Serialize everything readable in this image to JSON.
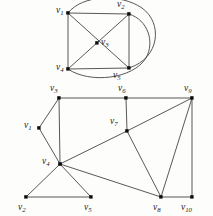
{
  "figure": {
    "background_color": "#fdfdfc",
    "edge_color": "#3a3a3a",
    "vertex_color": "#0d0d0d",
    "label_color": "#1a1a1a"
  },
  "graphs": [
    {
      "id": "upper-graph",
      "name": "upper-graph",
      "vertex_count": 5,
      "edge_count": 8,
      "vertices": [
        {
          "id": "v1",
          "label_main": "v",
          "label_sub": "1",
          "x": 68,
          "y": 13,
          "label_x": 56,
          "label_y": 11,
          "label_anchor": "start"
        },
        {
          "id": "v2",
          "label_main": "v",
          "label_sub": "2",
          "x": 129,
          "y": 14,
          "label_x": 117,
          "label_y": 5,
          "label_anchor": "start"
        },
        {
          "id": "v3",
          "label_main": "v",
          "label_sub": "3",
          "x": 97,
          "y": 43,
          "label_x": 101,
          "label_y": 43,
          "label_anchor": "start"
        },
        {
          "id": "v4",
          "label_main": "v",
          "label_sub": "4",
          "x": 68,
          "y": 69,
          "label_x": 56,
          "label_y": 68,
          "label_anchor": "start"
        },
        {
          "id": "v5",
          "label_main": "v",
          "label_sub": "5",
          "x": 129,
          "y": 68,
          "label_x": 113,
          "label_y": 76,
          "label_anchor": "start"
        }
      ],
      "edges": [
        {
          "from": "v1",
          "to": "v2",
          "kind": "straight"
        },
        {
          "from": "v1",
          "to": "v4",
          "kind": "straight"
        },
        {
          "from": "v2",
          "to": "v5",
          "kind": "straight"
        },
        {
          "from": "v4",
          "to": "v5",
          "kind": "straight"
        },
        {
          "from": "v1",
          "to": "v5",
          "kind": "straight-diagonal"
        },
        {
          "from": "v2",
          "to": "v4",
          "kind": "straight-diagonal"
        },
        {
          "from": "v1",
          "to": "v5",
          "kind": "curved-outer",
          "note": "arc over top and right side"
        },
        {
          "from": "v2",
          "to": "v4",
          "kind": "curved-outer",
          "note": "arc over right side and bottom"
        }
      ]
    },
    {
      "id": "lower-graph",
      "name": "lower-graph",
      "vertex_count": 10,
      "edge_count": 15,
      "vertices": [
        {
          "id": "v1",
          "label_main": "v",
          "label_sub": "1",
          "x": 39,
          "y": 128,
          "label_x": 24,
          "label_y": 126,
          "label_anchor": "start"
        },
        {
          "id": "v2",
          "label_main": "v",
          "label_sub": "2",
          "x": 26,
          "y": 197,
          "label_x": 18,
          "label_y": 208,
          "label_anchor": "start"
        },
        {
          "id": "v3",
          "label_main": "v",
          "label_sub": "3",
          "x": 59,
          "y": 98,
          "label_x": 50,
          "label_y": 89,
          "label_anchor": "start"
        },
        {
          "id": "v4",
          "label_main": "v",
          "label_sub": "4",
          "x": 60,
          "y": 164,
          "label_x": 42,
          "label_y": 162,
          "label_anchor": "start"
        },
        {
          "id": "v5",
          "label_main": "v",
          "label_sub": "5",
          "x": 91,
          "y": 197,
          "label_x": 84,
          "label_y": 208,
          "label_anchor": "start"
        },
        {
          "id": "v6",
          "label_main": "v",
          "label_sub": "6",
          "x": 126,
          "y": 98,
          "label_x": 118,
          "label_y": 89,
          "label_anchor": "start"
        },
        {
          "id": "v7",
          "label_main": "v",
          "label_sub": "7",
          "x": 127,
          "y": 131,
          "label_x": 110,
          "label_y": 122,
          "label_anchor": "start"
        },
        {
          "id": "v8",
          "label_main": "v",
          "label_sub": "8",
          "x": 161,
          "y": 197,
          "label_x": 153,
          "label_y": 208,
          "label_anchor": "start"
        },
        {
          "id": "v9",
          "label_main": "v",
          "label_sub": "9",
          "x": 192,
          "y": 98,
          "label_x": 184,
          "label_y": 89,
          "label_anchor": "start"
        },
        {
          "id": "v10",
          "label_main": "v",
          "label_sub": "10",
          "x": 192,
          "y": 197,
          "label_x": 182,
          "label_y": 208,
          "label_anchor": "start"
        }
      ],
      "edges": [
        {
          "from": "v1",
          "to": "v3",
          "kind": "straight"
        },
        {
          "from": "v1",
          "to": "v4",
          "kind": "straight"
        },
        {
          "from": "v3",
          "to": "v4",
          "kind": "straight"
        },
        {
          "from": "v3",
          "to": "v6",
          "kind": "straight"
        },
        {
          "from": "v6",
          "to": "v9",
          "kind": "straight"
        },
        {
          "from": "v6",
          "to": "v7",
          "kind": "straight"
        },
        {
          "from": "v4",
          "to": "v7",
          "kind": "straight"
        },
        {
          "from": "v7",
          "to": "v9",
          "kind": "straight"
        },
        {
          "from": "v7",
          "to": "v8",
          "kind": "straight"
        },
        {
          "from": "v4",
          "to": "v2",
          "kind": "straight"
        },
        {
          "from": "v4",
          "to": "v5",
          "kind": "straight"
        },
        {
          "from": "v2",
          "to": "v5",
          "kind": "straight"
        },
        {
          "from": "v4",
          "to": "v8",
          "kind": "straight"
        },
        {
          "from": "v8",
          "to": "v9",
          "kind": "straight"
        },
        {
          "from": "v8",
          "to": "v10",
          "kind": "straight"
        },
        {
          "from": "v9",
          "to": "v10",
          "kind": "straight"
        }
      ]
    }
  ]
}
